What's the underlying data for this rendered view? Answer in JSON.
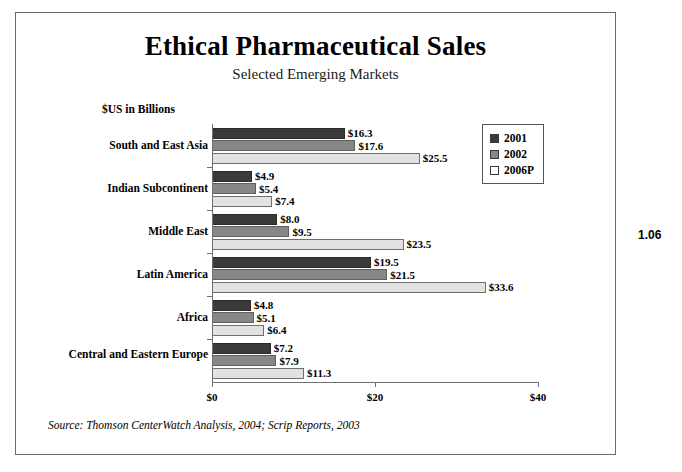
{
  "figure_number": "1.06",
  "chart_data": {
    "type": "bar",
    "orientation": "horizontal",
    "title": "Ethical Pharmaceutical Sales",
    "subtitle": "Selected Emerging Markets",
    "units_label": "$US in Billions",
    "xlabel": "",
    "ylabel": "",
    "xlim": [
      0,
      40
    ],
    "xticks": [
      0,
      20,
      40
    ],
    "xtick_labels": [
      "$0",
      "$20",
      "$40"
    ],
    "grid": false,
    "legend_position": "upper-right-inside",
    "categories": [
      "South and East Asia",
      "Indian Subcontinent",
      "Middle East",
      "Latin America",
      "Africa",
      "Central and Eastern Europe"
    ],
    "series": [
      {
        "name": "2001",
        "color": "#3a3a3a",
        "values": [
          16.3,
          4.9,
          8.0,
          19.5,
          4.8,
          7.2
        ],
        "labels": [
          "$16.3",
          "$4.9",
          "$8.0",
          "$19.5",
          "$4.8",
          "$7.2"
        ]
      },
      {
        "name": "2002",
        "color": "#878787",
        "values": [
          17.6,
          5.4,
          9.5,
          21.5,
          5.1,
          7.9
        ],
        "labels": [
          "$17.6",
          "$5.4",
          "$9.5",
          "$21.5",
          "$5.1",
          "$7.9"
        ]
      },
      {
        "name": "2006P",
        "color": "#e2e2e2",
        "values": [
          25.5,
          7.4,
          23.5,
          33.6,
          6.4,
          11.3
        ],
        "labels": [
          "$25.5",
          "$7.4",
          "$23.5",
          "$33.6",
          "$6.4",
          "$11.3"
        ]
      }
    ],
    "source": "Source: Thomson CenterWatch Analysis, 2004; Scrip Reports, 2003"
  }
}
